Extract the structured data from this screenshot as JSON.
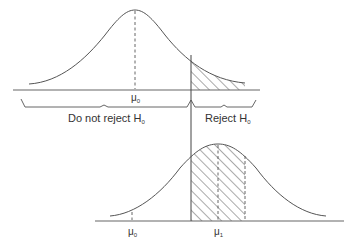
{
  "diagram": {
    "top_panel": {
      "mean_label": "μ",
      "mean_subscript": "0",
      "region_left_label": "Do not reject H",
      "region_left_subscript": "0",
      "region_right_label": "Reject H",
      "region_right_subscript": "0"
    },
    "bottom_panel": {
      "mean0_label": "μ",
      "mean0_subscript": "0",
      "mean1_label": "μ",
      "mean1_subscript": "1"
    },
    "colors": {
      "line": "#555555",
      "text": "#333333",
      "background": "#ffffff"
    }
  }
}
